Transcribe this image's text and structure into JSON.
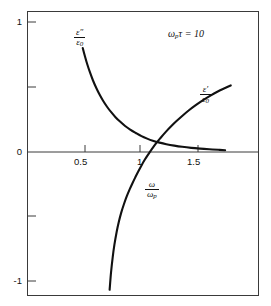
{
  "chart_data": {
    "type": "line",
    "title": "",
    "subtitle": "",
    "xlabel_num": "ω",
    "xlabel_den": "ω",
    "xlabel_den_sub": "p",
    "ylabel": "",
    "xlim": [
      0.28,
      1.78
    ],
    "ylim": [
      -1.1,
      1.1
    ],
    "grid": false,
    "legend": "inline-annotations",
    "annotation": {
      "omega": "ω",
      "omega_sub": "p",
      "tau": "τ",
      "equals": " = ",
      "value": "10",
      "text": "ωₚτ = 10"
    },
    "xticks": [
      0.5,
      1,
      1.5
    ],
    "xtick_labels": [
      "0.5",
      "1",
      "1.5"
    ],
    "yticks": [
      -1,
      -0.5,
      0,
      0.5,
      1
    ],
    "ytick_labels": [
      "-1",
      "",
      "0",
      "",
      "1"
    ],
    "axis_color": "#3a3a3a",
    "curve_color": "#111111",
    "series": [
      {
        "name": "eps_imag_over_eps0",
        "label_num": "ε″",
        "label_den": "ε",
        "label_den_sub": "0",
        "points": [
          [
            0.48,
            0.8
          ],
          [
            0.5,
            0.735
          ],
          [
            0.52,
            0.675
          ],
          [
            0.545,
            0.61
          ],
          [
            0.57,
            0.552
          ],
          [
            0.6,
            0.492
          ],
          [
            0.63,
            0.44
          ],
          [
            0.66,
            0.394
          ],
          [
            0.695,
            0.348
          ],
          [
            0.73,
            0.308
          ],
          [
            0.77,
            0.268
          ],
          [
            0.81,
            0.234
          ],
          [
            0.855,
            0.2
          ],
          [
            0.9,
            0.172
          ],
          [
            0.95,
            0.146
          ],
          [
            1.0,
            0.122
          ],
          [
            1.05,
            0.103
          ],
          [
            1.1,
            0.087
          ],
          [
            1.16,
            0.072
          ],
          [
            1.22,
            0.06
          ],
          [
            1.29,
            0.049
          ],
          [
            1.36,
            0.04
          ],
          [
            1.44,
            0.032
          ],
          [
            1.52,
            0.026
          ],
          [
            1.6,
            0.021
          ],
          [
            1.68,
            0.017
          ],
          [
            1.74,
            0.014
          ]
        ]
      },
      {
        "name": "eps_real_over_eps0",
        "label_num": "ε′",
        "label_den": "ε",
        "label_den_sub": "0",
        "points": [
          [
            0.718,
            -1.06
          ],
          [
            0.73,
            -0.93
          ],
          [
            0.745,
            -0.81
          ],
          [
            0.76,
            -0.715
          ],
          [
            0.78,
            -0.615
          ],
          [
            0.8,
            -0.535
          ],
          [
            0.82,
            -0.468
          ],
          [
            0.845,
            -0.4
          ],
          [
            0.87,
            -0.34
          ],
          [
            0.895,
            -0.288
          ],
          [
            0.92,
            -0.24
          ],
          [
            0.945,
            -0.195
          ],
          [
            0.97,
            -0.152
          ],
          [
            1.0,
            -0.103
          ],
          [
            1.03,
            -0.058
          ],
          [
            1.06,
            -0.018
          ],
          [
            1.09,
            0.02
          ],
          [
            1.13,
            0.068
          ],
          [
            1.17,
            0.11
          ],
          [
            1.215,
            0.155
          ],
          [
            1.26,
            0.196
          ],
          [
            1.31,
            0.238
          ],
          [
            1.365,
            0.281
          ],
          [
            1.42,
            0.321
          ],
          [
            1.48,
            0.36
          ],
          [
            1.545,
            0.399
          ],
          [
            1.61,
            0.434
          ],
          [
            1.675,
            0.465
          ],
          [
            1.74,
            0.492
          ],
          [
            1.79,
            0.512
          ]
        ]
      }
    ]
  },
  "labels": {
    "eps2_num": "ε″",
    "eps2_den_base": "ε",
    "eps2_den_sub": "0",
    "eps1_num": "ε′",
    "eps1_den_base": "ε",
    "eps1_den_sub": "0",
    "x_num": "ω",
    "x_den_base": "ω",
    "x_den_sub": "p"
  },
  "annotation_parts": {
    "omega": "ω",
    "omega_sub": "p",
    "tau_eq_value": "τ = 10"
  },
  "xtick_0": "0.5",
  "xtick_1": "1",
  "xtick_2": "1.5",
  "ytick_top": "1",
  "ytick_mid": "0",
  "ytick_bot": "-1"
}
